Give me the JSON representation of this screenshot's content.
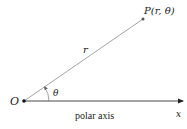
{
  "diagram": {
    "type": "polar-coordinates",
    "origin_label": "O",
    "point_label": "P(r, θ)",
    "radius_label": "r",
    "angle_label": "θ",
    "axis_label": "polar axis",
    "axis_end_label": "x",
    "colors": {
      "ray": "#9a9a9a",
      "axis": "#333333",
      "text": "#222222",
      "point": "#555555"
    }
  }
}
